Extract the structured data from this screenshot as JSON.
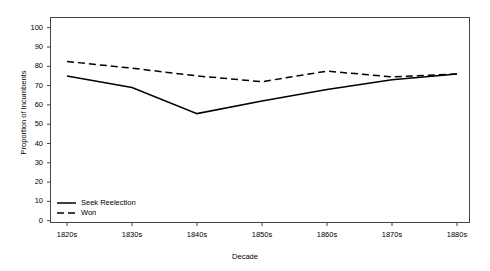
{
  "chart_data": {
    "type": "line",
    "title": "",
    "xlabel": "Decade",
    "ylabel": "Proportion of Incumbents",
    "categories": [
      "1820s",
      "1830s",
      "1840s",
      "1850s",
      "1860s",
      "1870s",
      "1880s"
    ],
    "ylim": [
      0,
      100
    ],
    "yticks": [
      0,
      10,
      20,
      30,
      40,
      50,
      60,
      70,
      80,
      90,
      100
    ],
    "grid": false,
    "legend_position": "bottom-left",
    "series": [
      {
        "name": "Seek Reelection",
        "style": "solid",
        "color": "#000000",
        "values": [
          75,
          69,
          55.5,
          62,
          68,
          73,
          76
        ]
      },
      {
        "name": "Won",
        "style": "dashed",
        "color": "#000000",
        "values": [
          82.5,
          79,
          75,
          72,
          77.5,
          74.5,
          76
        ]
      }
    ]
  },
  "axes": {
    "y_tick_labels": [
      "100",
      "90",
      "80",
      "70",
      "60",
      "50",
      "40",
      "30",
      "20",
      "10",
      "0"
    ],
    "x_tick_labels": [
      "1820s",
      "1830s",
      "1840s",
      "1850s",
      "1860s",
      "1870s",
      "1880s"
    ],
    "y_title": "Proportion of Incumbents",
    "x_title": "Decade"
  },
  "legend": {
    "items": [
      {
        "label": "Seek Reelection",
        "style": "solid"
      },
      {
        "label": "Won",
        "style": "dashed"
      }
    ]
  }
}
